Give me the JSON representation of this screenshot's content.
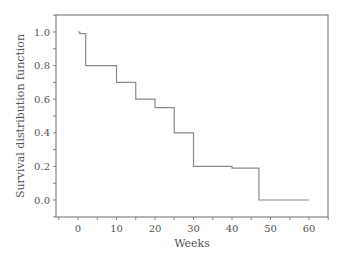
{
  "chart_data": {
    "type": "line",
    "subtype": "step (Kaplan-Meier survival curve)",
    "title": "",
    "xlabel": "Weeks",
    "ylabel": "Survival distribution function",
    "xlim": [
      -5,
      65
    ],
    "ylim": [
      -0.1,
      1.1
    ],
    "x_ticks": [
      0,
      10,
      20,
      30,
      40,
      50,
      60
    ],
    "x_tick_labels": [
      "0",
      "10",
      "20",
      "30",
      "40",
      "50",
      "60"
    ],
    "y_ticks": [
      0.0,
      0.2,
      0.4,
      0.6,
      0.8,
      1.0
    ],
    "y_tick_labels": [
      "0.0",
      "0.2",
      "0.4",
      "0.6",
      "0.8",
      "1.0"
    ],
    "grid": false,
    "legend": null,
    "series": [
      {
        "name": "Survival",
        "steps": [
          {
            "x": 0,
            "y": 1.0
          },
          {
            "x": 0.5,
            "y": 0.99
          },
          {
            "x": 2,
            "y": 0.8
          },
          {
            "x": 10,
            "y": 0.7
          },
          {
            "x": 15,
            "y": 0.6
          },
          {
            "x": 20,
            "y": 0.55
          },
          {
            "x": 25,
            "y": 0.4
          },
          {
            "x": 30,
            "y": 0.2
          },
          {
            "x": 40,
            "y": 0.19
          },
          {
            "x": 47,
            "y": 0.0
          },
          {
            "x": 60,
            "y": 0.0
          }
        ]
      }
    ],
    "colors": {
      "line": "#8a8a8a",
      "axis": "#6b6b6b",
      "text": "#555555"
    }
  }
}
